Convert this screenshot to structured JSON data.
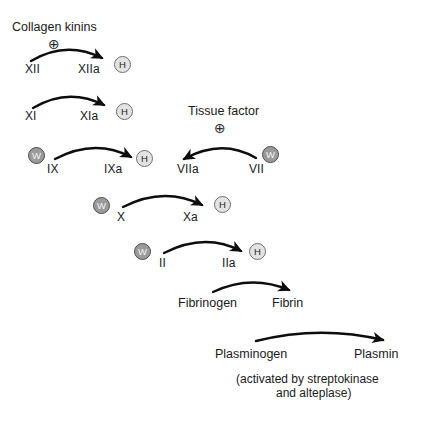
{
  "diagram": {
    "stimuli": [
      {
        "name": "collagen-kinins",
        "label": "Collagen kinins",
        "x": 12,
        "y": 21,
        "plus": "⊕",
        "plus_x": 48,
        "plus_y": 37
      },
      {
        "name": "tissue-factor",
        "label": "Tissue factor",
        "x": 188,
        "y": 105,
        "plus": "⊕",
        "plus_x": 214,
        "plus_y": 121
      }
    ],
    "factors": [
      {
        "name": "factor-xii",
        "label": "XII",
        "x": 25,
        "y": 63
      },
      {
        "name": "factor-xiia",
        "label": "XIIa",
        "x": 78,
        "y": 63
      },
      {
        "name": "factor-xi",
        "label": "XI",
        "x": 25,
        "y": 110
      },
      {
        "name": "factor-xia",
        "label": "XIa",
        "x": 80,
        "y": 110
      },
      {
        "name": "factor-ix",
        "label": "IX",
        "x": 47,
        "y": 163
      },
      {
        "name": "factor-ixa",
        "label": "IXa",
        "x": 104,
        "y": 163
      },
      {
        "name": "factor-viia",
        "label": "VIIa",
        "x": 177,
        "y": 163
      },
      {
        "name": "factor-vii",
        "label": "VII",
        "x": 249,
        "y": 163
      },
      {
        "name": "factor-x",
        "label": "X",
        "x": 117,
        "y": 211
      },
      {
        "name": "factor-xa",
        "label": "Xa",
        "x": 183,
        "y": 211
      },
      {
        "name": "factor-ii",
        "label": "II",
        "x": 159,
        "y": 257
      },
      {
        "name": "factor-iia",
        "label": "IIa",
        "x": 222,
        "y": 257
      },
      {
        "name": "fibrinogen",
        "label": "Fibrinogen",
        "x": 178,
        "y": 297
      },
      {
        "name": "fibrin",
        "label": "Fibrin",
        "x": 272,
        "y": 297
      },
      {
        "name": "plasminogen",
        "label": "Plasminogen",
        "x": 215,
        "y": 348
      },
      {
        "name": "plasmin",
        "label": "Plasmin",
        "x": 354,
        "y": 348
      }
    ],
    "cofactors": [
      {
        "name": "cofactor-hmwk-xiia",
        "type": "h",
        "label": "H",
        "x": 114,
        "y": 56
      },
      {
        "name": "cofactor-hmwk-xia",
        "type": "h",
        "label": "H",
        "x": 116,
        "y": 103
      },
      {
        "name": "cofactor-warfarin-ix",
        "type": "w",
        "label": "W",
        "x": 28,
        "y": 147
      },
      {
        "name": "cofactor-hmwk-ixa",
        "type": "h",
        "label": "H",
        "x": 136,
        "y": 150
      },
      {
        "name": "cofactor-warfarin-vii",
        "type": "w",
        "label": "W",
        "x": 262,
        "y": 146
      },
      {
        "name": "cofactor-warfarin-x",
        "type": "w",
        "label": "W",
        "x": 93,
        "y": 197
      },
      {
        "name": "cofactor-hmwk-xa",
        "type": "h",
        "label": "H",
        "x": 214,
        "y": 196
      },
      {
        "name": "cofactor-warfarin-ii",
        "type": "w",
        "label": "W",
        "x": 134,
        "y": 243
      },
      {
        "name": "cofactor-hmwk-iia",
        "type": "h",
        "label": "H",
        "x": 249,
        "y": 243
      }
    ],
    "arrows": [
      {
        "name": "arrow-xii-to-xiia",
        "from": "XII",
        "to": "XIIa",
        "direction": "right"
      },
      {
        "name": "arrow-xi-to-xia",
        "from": "XI",
        "to": "XIa",
        "direction": "right"
      },
      {
        "name": "arrow-ix-to-ixa",
        "from": "IX",
        "to": "IXa",
        "direction": "right"
      },
      {
        "name": "arrow-vii-to-viia",
        "from": "VII",
        "to": "VIIa",
        "direction": "left"
      },
      {
        "name": "arrow-x-to-xa",
        "from": "X",
        "to": "Xa",
        "direction": "right"
      },
      {
        "name": "arrow-ii-to-iia",
        "from": "II",
        "to": "IIa",
        "direction": "right"
      },
      {
        "name": "arrow-fibrinogen-to-fibrin",
        "from": "Fibrinogen",
        "to": "Fibrin",
        "direction": "right"
      },
      {
        "name": "arrow-plasminogen-to-plasmin",
        "from": "Plasminogen",
        "to": "Plasmin",
        "direction": "right"
      }
    ],
    "note": {
      "line1": "(activated by streptokinase",
      "line2": "and alteplase)",
      "x": 236,
      "y": 372
    },
    "legend_keys": {
      "h_meaning": "H",
      "w_meaning": "W"
    },
    "colors": {
      "ink": "#1a1a1a",
      "arrow": "#0d0d0d",
      "cofactor_h_fill": "#e3e3e3",
      "cofactor_h_ring": "#6e6e6e",
      "cofactor_w_fill": "#9a9a9a",
      "cofactor_w_ring": "#4d4d4d",
      "background": "#ffffff"
    }
  }
}
